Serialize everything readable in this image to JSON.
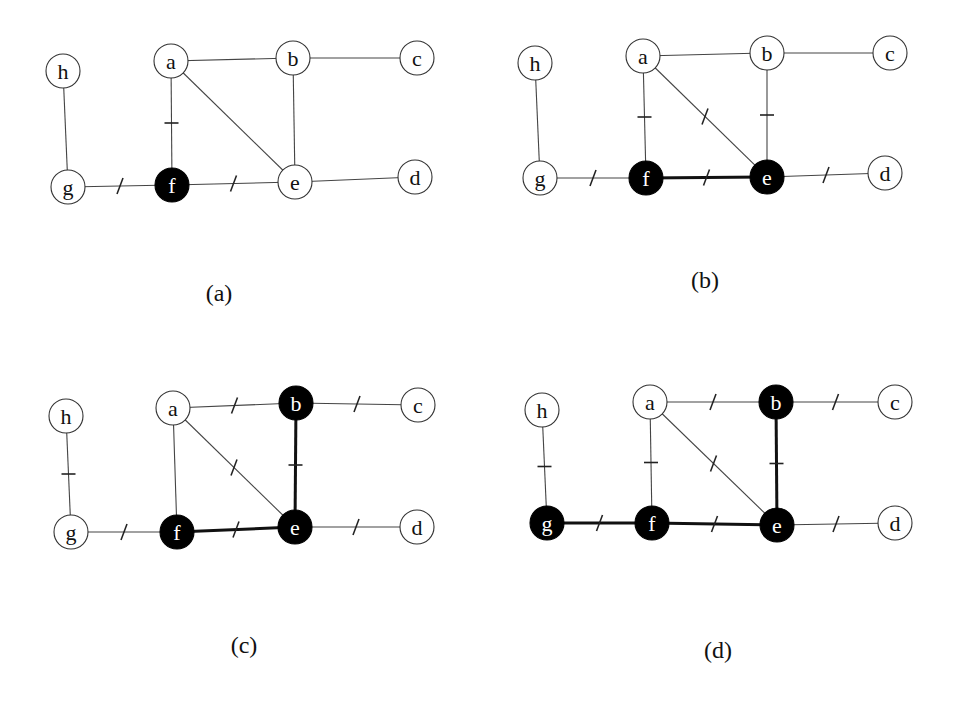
{
  "figure": {
    "node_radius": 17,
    "colors": {
      "background": "#ffffff",
      "filled": "#000000",
      "edge": "#444444",
      "text": "#111111"
    },
    "edges": [
      [
        "h",
        "g"
      ],
      [
        "a",
        "b"
      ],
      [
        "b",
        "c"
      ],
      [
        "a",
        "f"
      ],
      [
        "a",
        "e"
      ],
      [
        "b",
        "e"
      ],
      [
        "g",
        "f"
      ],
      [
        "f",
        "e"
      ],
      [
        "e",
        "d"
      ]
    ],
    "panels": [
      {
        "id": "a",
        "caption": "(a)",
        "caption_pos": [
          219,
          293
        ],
        "nodes": {
          "h": [
            63,
            71
          ],
          "a": [
            171,
            61
          ],
          "b": [
            293,
            58
          ],
          "c": [
            417,
            58
          ],
          "g": [
            68,
            187
          ],
          "f": [
            172,
            185
          ],
          "e": [
            295,
            182
          ],
          "d": [
            415,
            177
          ]
        },
        "filled": [
          "f"
        ],
        "thick_edges": [],
        "marked_edges": [
          [
            "a",
            "f"
          ],
          [
            "g",
            "f"
          ],
          [
            "f",
            "e"
          ]
        ]
      },
      {
        "id": "b",
        "caption": "(b)",
        "caption_pos": [
          705,
          280
        ],
        "nodes": {
          "h": [
            535,
            63
          ],
          "a": [
            643,
            56
          ],
          "b": [
            767,
            53
          ],
          "c": [
            890,
            53
          ],
          "g": [
            540,
            178
          ],
          "f": [
            646,
            178
          ],
          "e": [
            767,
            177
          ],
          "d": [
            885,
            173
          ]
        },
        "filled": [
          "f",
          "e"
        ],
        "thick_edges": [
          [
            "f",
            "e"
          ]
        ],
        "marked_edges": [
          [
            "a",
            "f"
          ],
          [
            "a",
            "e"
          ],
          [
            "b",
            "e"
          ],
          [
            "g",
            "f"
          ],
          [
            "f",
            "e"
          ],
          [
            "e",
            "d"
          ]
        ]
      },
      {
        "id": "c",
        "caption": "(c)",
        "caption_pos": [
          244,
          645
        ],
        "nodes": {
          "h": [
            66,
            416
          ],
          "a": [
            173,
            408
          ],
          "b": [
            296,
            403
          ],
          "c": [
            418,
            405
          ],
          "g": [
            71,
            532
          ],
          "f": [
            177,
            532
          ],
          "e": [
            295,
            527
          ],
          "d": [
            417,
            527
          ]
        },
        "filled": [
          "f",
          "e",
          "b"
        ],
        "thick_edges": [
          [
            "f",
            "e"
          ],
          [
            "b",
            "e"
          ]
        ],
        "marked_edges": [
          [
            "h",
            "g"
          ],
          [
            "a",
            "b"
          ],
          [
            "b",
            "c"
          ],
          [
            "a",
            "e"
          ],
          [
            "b",
            "e"
          ],
          [
            "g",
            "f"
          ],
          [
            "f",
            "e"
          ],
          [
            "e",
            "d"
          ]
        ]
      },
      {
        "id": "d",
        "caption": "(d)",
        "caption_pos": [
          718,
          650
        ],
        "nodes": {
          "h": [
            542,
            410
          ],
          "a": [
            650,
            402
          ],
          "b": [
            776,
            402
          ],
          "c": [
            895,
            402
          ],
          "g": [
            547,
            523
          ],
          "f": [
            652,
            523
          ],
          "e": [
            777,
            525
          ],
          "d": [
            895,
            523
          ]
        },
        "filled": [
          "g",
          "f",
          "e",
          "b"
        ],
        "thick_edges": [
          [
            "g",
            "f"
          ],
          [
            "f",
            "e"
          ],
          [
            "b",
            "e"
          ]
        ],
        "marked_edges": [
          [
            "h",
            "g"
          ],
          [
            "a",
            "b"
          ],
          [
            "b",
            "c"
          ],
          [
            "a",
            "f"
          ],
          [
            "a",
            "e"
          ],
          [
            "b",
            "e"
          ],
          [
            "g",
            "f"
          ],
          [
            "f",
            "e"
          ],
          [
            "e",
            "d"
          ]
        ]
      }
    ]
  }
}
